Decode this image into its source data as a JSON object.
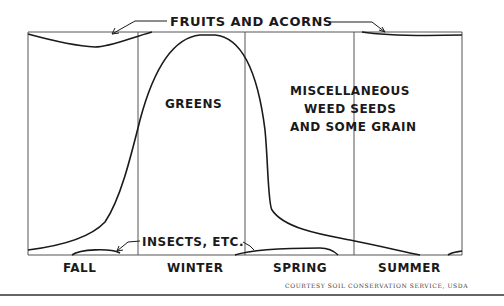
{
  "diagram": {
    "title_label": "FRUITS AND ACORNS",
    "regions": [
      {
        "label_lines": [
          "GREENS"
        ]
      },
      {
        "label_lines": [
          "MISCELLANEOUS",
          "WEED SEEDS",
          "AND SOME GRAIN"
        ]
      }
    ],
    "bottom_label": "INSECTS, ETC.",
    "seasons": [
      "FALL",
      "WINTER",
      "SPRING",
      "SUMMER"
    ],
    "credit": "COURTESY SOIL CONSERVATION SERVICE, USDA",
    "colors": {
      "ink": "#1a1a1a",
      "frame": "#555555",
      "background": "#ffffff"
    }
  }
}
